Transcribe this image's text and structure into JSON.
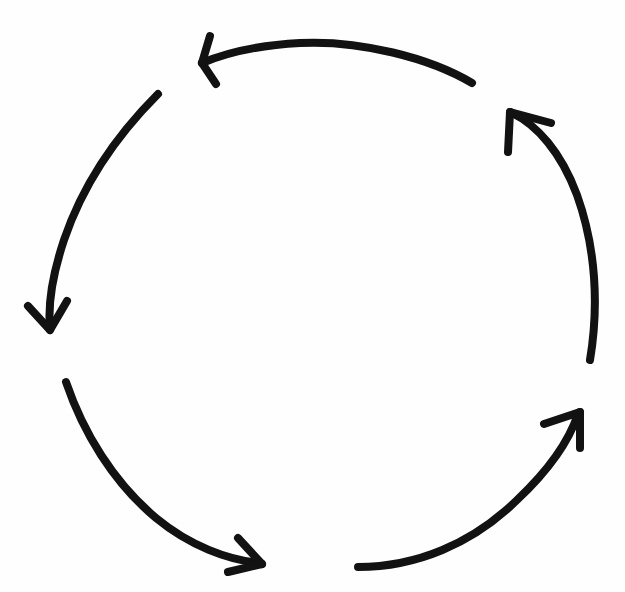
{
  "document": {
    "title": "Four-arrow circular cycle diagram",
    "kind": "hand-drawn-sketch",
    "background_color": "#fefefe",
    "stroke_color": "#121212",
    "canvas": {
      "width": 625,
      "height": 592
    }
  },
  "diagram": {
    "name": "cyclical-process-arrows",
    "shape": "circle",
    "direction": "counterclockwise",
    "arrow_count": 4,
    "labels_present": false,
    "center": {
      "x": 312,
      "y": 300
    },
    "radius_x": 262,
    "radius_y": 266,
    "stroke_width": 8,
    "arrows": [
      {
        "id": "arrow-top",
        "name": "top-arc-arrow",
        "points_to": "left",
        "quadrant": "top",
        "start_angle_deg": -55,
        "end_angle_deg": -142,
        "tail": {
          "x": 472,
          "y": 83
        },
        "tip": {
          "x": 200,
          "y": 62
        },
        "path": "M 472 83 C 430 58, 360 40, 300 43 C 262 45, 228 52, 202 63",
        "head_left": "M 202 63 L 216 84",
        "head_right": "M 202 63 L 210 36"
      },
      {
        "id": "arrow-left",
        "name": "left-arc-arrow",
        "points_to": "down",
        "quadrant": "left",
        "start_angle_deg": 206,
        "end_angle_deg": 95,
        "tail": {
          "x": 158,
          "y": 94
        },
        "tip": {
          "x": 50,
          "y": 330
        },
        "path": "M 158 94 C 118 134, 83 184, 64 240 C 52 276, 48 306, 50 328",
        "head_left": "M 50 330 L 28 306",
        "head_right": "M 50 330 L 67 301"
      },
      {
        "id": "arrow-bottom-left",
        "name": "bottom-left-arc-arrow",
        "points_to": "down-right",
        "quadrant": "bottom-left",
        "start_angle_deg": 95,
        "end_angle_deg": 30,
        "tail": {
          "x": 66,
          "y": 382
        },
        "tip": {
          "x": 262,
          "y": 564
        },
        "path": "M 66 382 C 83 432, 113 482, 156 518 C 190 546, 228 560, 260 563",
        "head_left": "M 262 564 L 228 572",
        "head_right": "M 262 564 L 238 538"
      },
      {
        "id": "arrow-bottom-right",
        "name": "bottom-right-arc-arrow",
        "points_to": "up-right",
        "quadrant": "bottom-right",
        "start_angle_deg": 160,
        "end_angle_deg": 62,
        "tail": {
          "x": 358,
          "y": 567
        },
        "tip": {
          "x": 580,
          "y": 412
        },
        "path": "M 358 567 C 416 567, 472 544, 517 500 C 551 468, 570 438, 578 414",
        "head_left": "M 580 412 L 544 424",
        "head_right": "M 580 412 L 580 448"
      },
      {
        "id": "arrow-right",
        "name": "right-arc-arrow",
        "points_to": "up-left",
        "quadrant": "right",
        "start_angle_deg": 45,
        "end_angle_deg": -48,
        "tail": {
          "x": 590,
          "y": 360
        },
        "tip": {
          "x": 510,
          "y": 112
        },
        "path": "M 590 360 C 599 306, 596 248, 577 195 C 561 152, 537 125, 512 113",
        "head_left": "M 510 112 L 508 152",
        "head_right": "M 510 112 L 551 123"
      }
    ]
  }
}
